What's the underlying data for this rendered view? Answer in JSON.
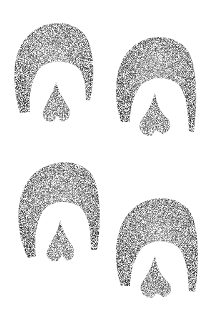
{
  "scene": {
    "description": "Four horse hoof prints drawn in stippled pencil style on a white background",
    "background_color": "#ffffff",
    "ink_color": "#2a2a2a",
    "prints": [
      {
        "id": "hoofprint-top-left",
        "wall": {
          "left": 15,
          "right": 93,
          "top": 22,
          "bottom_left": 113,
          "bottom_right": 100,
          "inner_top": 62,
          "inner_left": 30,
          "inner_right": 80
        },
        "frog": {
          "apex_x": 56,
          "apex_y": 82,
          "left": 42,
          "right": 70,
          "bottom": 123
        }
      },
      {
        "id": "hoofprint-top-right",
        "wall": {
          "left": 116,
          "right": 196,
          "top": 35,
          "bottom_left": 122,
          "bottom_right": 132,
          "inner_top": 77,
          "inner_left": 132,
          "inner_right": 182
        },
        "frog": {
          "apex_x": 155,
          "apex_y": 93,
          "left": 139,
          "right": 171,
          "bottom": 137
        }
      },
      {
        "id": "hoofprint-bottom-left",
        "wall": {
          "left": 17,
          "right": 100,
          "top": 161,
          "bottom_left": 258,
          "bottom_right": 250,
          "inner_top": 202,
          "inner_left": 35,
          "inner_right": 88
        },
        "frog": {
          "apex_x": 60,
          "apex_y": 220,
          "left": 45,
          "right": 75,
          "bottom": 262
        }
      },
      {
        "id": "hoofprint-bottom-right",
        "wall": {
          "left": 116,
          "right": 198,
          "top": 197,
          "bottom_left": 286,
          "bottom_right": 292,
          "inner_top": 240,
          "inner_left": 133,
          "inner_right": 183
        },
        "frog": {
          "apex_x": 155,
          "apex_y": 256,
          "left": 140,
          "right": 172,
          "bottom": 298
        }
      }
    ]
  }
}
